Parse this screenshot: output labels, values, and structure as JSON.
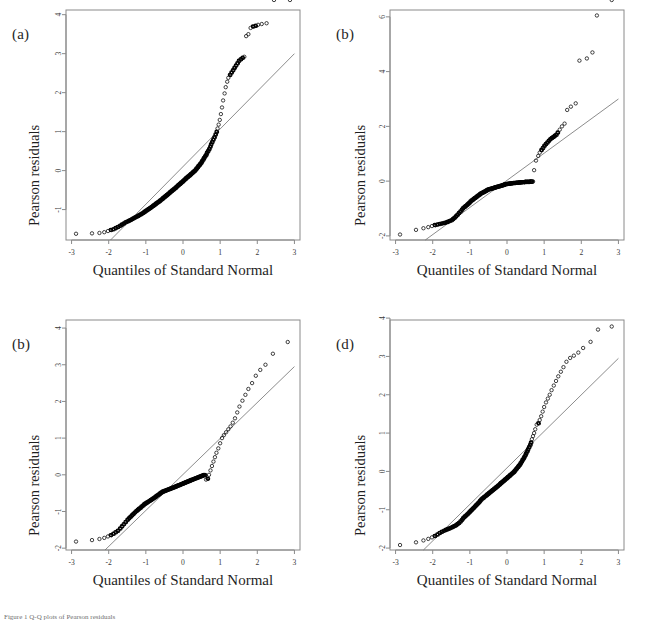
{
  "figure": {
    "caption": "Figure 1 Q-Q plots of Pearson residuals",
    "panel_count": 4,
    "background": "#ffffff",
    "marker_color": "#111111",
    "refline_color": "#6e6e6e",
    "frame_color": "#8a8a8a"
  },
  "chart_data": [
    {
      "type": "scatter",
      "panel": "a",
      "title": "(a)",
      "xlabel": "Quantiles of Standard Normal",
      "ylabel": "Pearson residuals",
      "xlim": [
        -3.15,
        3.15
      ],
      "ylim": [
        -1.78,
        4.12
      ],
      "xticks": [
        -3,
        -2,
        -1,
        0,
        1,
        2,
        3
      ],
      "xticklabels": [
        "-3",
        "-2",
        "-1",
        "0",
        "1",
        "2",
        "3"
      ],
      "yticks": [
        -1,
        0,
        1,
        2,
        3,
        4
      ],
      "yticklabels": [
        "-1",
        "0",
        "1",
        "2",
        "3",
        "4"
      ],
      "grid": false,
      "legend": null,
      "refline": {
        "x": [
          -1.95,
          3.0
        ],
        "y": [
          -1.78,
          3.0
        ],
        "slope": 0.9657,
        "intercept": 0.103
      },
      "x": [
        -2.88,
        -2.45,
        -2.25,
        -2.12,
        -2.02,
        -1.95,
        -1.88,
        -1.82,
        -1.76,
        -1.7,
        -1.65,
        -1.6,
        -1.55,
        -1.5,
        -1.46,
        -1.42,
        -1.38,
        -1.34,
        -1.3,
        -1.26,
        -1.22,
        -1.19,
        -1.15,
        -1.12,
        -1.08,
        -1.05,
        -1.02,
        -0.99,
        -0.96,
        -0.93,
        -0.9,
        -0.87,
        -0.84,
        -0.81,
        -0.78,
        -0.75,
        -0.73,
        -0.7,
        -0.67,
        -0.64,
        -0.62,
        -0.59,
        -0.56,
        -0.54,
        -0.51,
        -0.49,
        -0.46,
        -0.44,
        -0.41,
        -0.39,
        -0.36,
        -0.34,
        -0.31,
        -0.29,
        -0.26,
        -0.24,
        -0.21,
        -0.19,
        -0.17,
        -0.14,
        -0.12,
        -0.09,
        -0.07,
        -0.05,
        -0.02,
        0.0,
        0.02,
        0.05,
        0.07,
        0.09,
        0.12,
        0.14,
        0.17,
        0.19,
        0.21,
        0.24,
        0.26,
        0.29,
        0.31,
        0.34,
        0.36,
        0.39,
        0.41,
        0.44,
        0.46,
        0.49,
        0.51,
        0.54,
        0.56,
        0.59,
        0.62,
        0.64,
        0.67,
        0.7,
        0.73,
        0.75,
        0.78,
        0.81,
        0.84,
        0.87,
        0.9,
        0.93,
        0.96,
        0.99,
        1.02,
        1.05,
        1.08,
        1.12,
        1.15,
        1.19,
        1.22,
        1.26,
        1.3,
        1.34,
        1.38,
        1.42,
        1.46,
        1.5,
        1.55,
        1.6,
        1.65,
        1.7,
        1.76,
        1.82,
        1.88,
        1.95,
        2.02,
        2.12,
        2.25,
        2.45,
        2.88
      ],
      "y": [
        -1.62,
        -1.61,
        -1.6,
        -1.58,
        -1.55,
        -1.52,
        -1.5,
        -1.47,
        -1.44,
        -1.41,
        -1.38,
        -1.35,
        -1.32,
        -1.3,
        -1.28,
        -1.26,
        -1.24,
        -1.22,
        -1.2,
        -1.18,
        -1.16,
        -1.14,
        -1.12,
        -1.1,
        -1.08,
        -1.06,
        -1.04,
        -1.02,
        -1.0,
        -0.98,
        -0.96,
        -0.94,
        -0.92,
        -0.9,
        -0.88,
        -0.86,
        -0.84,
        -0.82,
        -0.8,
        -0.78,
        -0.76,
        -0.74,
        -0.72,
        -0.7,
        -0.68,
        -0.66,
        -0.64,
        -0.62,
        -0.6,
        -0.58,
        -0.56,
        -0.54,
        -0.52,
        -0.5,
        -0.48,
        -0.46,
        -0.44,
        -0.42,
        -0.4,
        -0.38,
        -0.36,
        -0.34,
        -0.32,
        -0.3,
        -0.28,
        -0.26,
        -0.24,
        -0.22,
        -0.2,
        -0.18,
        -0.16,
        -0.14,
        -0.12,
        -0.1,
        -0.08,
        -0.06,
        -0.04,
        -0.02,
        0.0,
        0.03,
        0.06,
        0.09,
        0.12,
        0.15,
        0.18,
        0.21,
        0.25,
        0.29,
        0.33,
        0.37,
        0.41,
        0.46,
        0.51,
        0.56,
        0.62,
        0.68,
        0.74,
        0.8,
        0.86,
        0.93,
        1.0,
        1.08,
        1.18,
        1.3,
        1.45,
        1.62,
        1.8,
        1.98,
        2.14,
        2.28,
        2.38,
        2.46,
        2.52,
        2.58,
        2.64,
        2.7,
        2.76,
        2.82,
        2.86,
        2.9,
        2.92,
        3.45,
        3.5,
        3.66,
        3.7,
        3.72,
        3.74,
        3.76,
        3.78
      ]
    },
    {
      "type": "scatter",
      "panel": "b",
      "title": "(b)",
      "xlabel": "Quantiles of Standard Normal",
      "ylabel": "Pearson residuals",
      "xlim": [
        -3.15,
        3.15
      ],
      "ylim": [
        -2.15,
        6.25
      ],
      "xticks": [
        -3,
        -2,
        -1,
        0,
        1,
        2,
        3
      ],
      "xticklabels": [
        "-3",
        "-2",
        "-1",
        "0",
        "1",
        "2",
        "3"
      ],
      "yticks": [
        -2,
        0,
        2,
        4,
        6
      ],
      "yticklabels": [
        "-2",
        "0",
        "2",
        "4",
        "6"
      ],
      "grid": false,
      "legend": null,
      "refline": {
        "x": [
          -2.2,
          3.0
        ],
        "y": [
          -2.15,
          3.0
        ],
        "slope": 0.9904,
        "intercept": 0.0288
      },
      "x": [
        -2.88,
        -2.45,
        -2.25,
        -2.12,
        -2.02,
        -1.95,
        -1.88,
        -1.82,
        -1.76,
        -1.7,
        -1.65,
        -1.6,
        -1.55,
        -1.5,
        -1.46,
        -1.42,
        -1.38,
        -1.34,
        -1.3,
        -1.26,
        -1.22,
        -1.19,
        -1.15,
        -1.12,
        -1.08,
        -1.05,
        -1.02,
        -0.99,
        -0.96,
        -0.93,
        -0.9,
        -0.87,
        -0.84,
        -0.81,
        -0.78,
        -0.75,
        -0.73,
        -0.7,
        -0.67,
        -0.64,
        -0.62,
        -0.59,
        -0.56,
        -0.54,
        -0.51,
        -0.49,
        -0.46,
        -0.44,
        -0.41,
        -0.39,
        -0.36,
        -0.34,
        -0.31,
        -0.29,
        -0.26,
        -0.24,
        -0.21,
        -0.19,
        -0.17,
        -0.14,
        -0.12,
        -0.09,
        -0.07,
        -0.05,
        -0.02,
        0.0,
        0.02,
        0.05,
        0.07,
        0.09,
        0.12,
        0.14,
        0.17,
        0.19,
        0.21,
        0.24,
        0.26,
        0.29,
        0.31,
        0.34,
        0.36,
        0.39,
        0.41,
        0.44,
        0.46,
        0.49,
        0.51,
        0.54,
        0.56,
        0.59,
        0.62,
        0.64,
        0.67,
        0.7,
        0.73,
        0.78,
        0.84,
        0.88,
        0.92,
        0.96,
        1.0,
        1.04,
        1.08,
        1.12,
        1.16,
        1.2,
        1.24,
        1.28,
        1.32,
        1.36,
        1.42,
        1.48,
        1.55,
        1.62,
        1.72,
        1.85,
        1.95,
        2.15,
        2.3,
        2.42,
        2.82
      ],
      "y": [
        -1.95,
        -1.78,
        -1.72,
        -1.68,
        -1.64,
        -1.6,
        -1.58,
        -1.56,
        -1.54,
        -1.52,
        -1.5,
        -1.48,
        -1.45,
        -1.42,
        -1.38,
        -1.33,
        -1.28,
        -1.22,
        -1.16,
        -1.1,
        -1.04,
        -0.98,
        -0.94,
        -0.9,
        -0.86,
        -0.82,
        -0.78,
        -0.74,
        -0.7,
        -0.67,
        -0.64,
        -0.61,
        -0.58,
        -0.55,
        -0.52,
        -0.49,
        -0.46,
        -0.44,
        -0.42,
        -0.4,
        -0.38,
        -0.36,
        -0.34,
        -0.32,
        -0.3,
        -0.29,
        -0.28,
        -0.27,
        -0.26,
        -0.25,
        -0.24,
        -0.23,
        -0.22,
        -0.21,
        -0.2,
        -0.19,
        -0.18,
        -0.17,
        -0.16,
        -0.15,
        -0.14,
        -0.13,
        -0.12,
        -0.11,
        -0.1,
        -0.1,
        -0.09,
        -0.09,
        -0.08,
        -0.08,
        -0.07,
        -0.07,
        -0.06,
        -0.06,
        -0.06,
        -0.05,
        -0.05,
        -0.05,
        -0.04,
        -0.04,
        -0.04,
        -0.03,
        -0.03,
        -0.03,
        -0.03,
        -0.02,
        -0.02,
        -0.02,
        -0.02,
        -0.02,
        -0.01,
        -0.01,
        -0.01,
        -0.01,
        0.4,
        0.75,
        0.92,
        1.04,
        1.14,
        1.22,
        1.3,
        1.36,
        1.42,
        1.48,
        1.54,
        1.58,
        1.62,
        1.66,
        1.7,
        1.78,
        1.88,
        2.0,
        2.1,
        2.6,
        2.72,
        2.84,
        4.4,
        4.48,
        4.7,
        6.05
      ]
    },
    {
      "type": "scatter",
      "panel": "c",
      "title": "(b)",
      "xlabel": "Quantiles of Standard Normal",
      "ylabel": "Pearson residuals",
      "xlim": [
        -3.15,
        3.15
      ],
      "ylim": [
        -2.05,
        4.22
      ],
      "xticks": [
        -3,
        -2,
        -1,
        0,
        1,
        2,
        3
      ],
      "xticklabels": [
        "-3",
        "-2",
        "-1",
        "0",
        "1",
        "2",
        "3"
      ],
      "yticks": [
        -2,
        -1,
        0,
        1,
        2,
        3,
        4
      ],
      "yticklabels": [
        "-2",
        "-1",
        "0",
        "1",
        "2",
        "3",
        "4"
      ],
      "grid": false,
      "legend": null,
      "refline": {
        "x": [
          -2.1,
          3.0
        ],
        "y": [
          -2.05,
          2.95
        ],
        "slope": 0.9804,
        "intercept": 0.0088
      },
      "x": [
        -2.88,
        -2.45,
        -2.25,
        -2.12,
        -2.02,
        -1.95,
        -1.88,
        -1.82,
        -1.76,
        -1.7,
        -1.65,
        -1.6,
        -1.55,
        -1.5,
        -1.46,
        -1.42,
        -1.38,
        -1.34,
        -1.3,
        -1.26,
        -1.22,
        -1.19,
        -1.15,
        -1.12,
        -1.08,
        -1.05,
        -1.02,
        -0.99,
        -0.96,
        -0.93,
        -0.9,
        -0.87,
        -0.84,
        -0.81,
        -0.78,
        -0.75,
        -0.73,
        -0.7,
        -0.67,
        -0.64,
        -0.62,
        -0.59,
        -0.56,
        -0.54,
        -0.51,
        -0.49,
        -0.46,
        -0.44,
        -0.41,
        -0.39,
        -0.36,
        -0.34,
        -0.31,
        -0.29,
        -0.26,
        -0.24,
        -0.21,
        -0.19,
        -0.17,
        -0.14,
        -0.12,
        -0.09,
        -0.07,
        -0.05,
        -0.02,
        0.0,
        0.02,
        0.05,
        0.07,
        0.09,
        0.12,
        0.14,
        0.17,
        0.19,
        0.21,
        0.24,
        0.26,
        0.29,
        0.31,
        0.34,
        0.36,
        0.39,
        0.41,
        0.44,
        0.46,
        0.49,
        0.51,
        0.54,
        0.56,
        0.59,
        0.62,
        0.66,
        0.7,
        0.74,
        0.78,
        0.82,
        0.86,
        0.9,
        0.95,
        1.0,
        1.05,
        1.1,
        1.16,
        1.22,
        1.28,
        1.34,
        1.4,
        1.46,
        1.52,
        1.6,
        1.68,
        1.76,
        1.86,
        1.96,
        2.08,
        2.22,
        2.42,
        2.82
      ],
      "y": [
        -1.82,
        -1.78,
        -1.75,
        -1.72,
        -1.68,
        -1.64,
        -1.6,
        -1.56,
        -1.52,
        -1.46,
        -1.4,
        -1.34,
        -1.28,
        -1.22,
        -1.18,
        -1.14,
        -1.1,
        -1.06,
        -1.02,
        -0.98,
        -0.95,
        -0.92,
        -0.89,
        -0.86,
        -0.83,
        -0.8,
        -0.78,
        -0.76,
        -0.74,
        -0.72,
        -0.7,
        -0.68,
        -0.66,
        -0.64,
        -0.62,
        -0.6,
        -0.58,
        -0.56,
        -0.54,
        -0.52,
        -0.5,
        -0.48,
        -0.46,
        -0.45,
        -0.44,
        -0.43,
        -0.42,
        -0.41,
        -0.4,
        -0.39,
        -0.38,
        -0.37,
        -0.36,
        -0.35,
        -0.34,
        -0.33,
        -0.32,
        -0.31,
        -0.3,
        -0.29,
        -0.28,
        -0.27,
        -0.26,
        -0.25,
        -0.24,
        -0.23,
        -0.22,
        -0.21,
        -0.2,
        -0.19,
        -0.18,
        -0.17,
        -0.16,
        -0.15,
        -0.14,
        -0.13,
        -0.12,
        -0.11,
        -0.1,
        -0.09,
        -0.08,
        -0.07,
        -0.06,
        -0.05,
        -0.04,
        -0.03,
        -0.02,
        -0.01,
        0.0,
        0.0,
        -0.13,
        -0.1,
        0.0,
        0.12,
        0.24,
        0.36,
        0.48,
        0.6,
        0.72,
        0.86,
        1.0,
        1.08,
        1.16,
        1.24,
        1.32,
        1.42,
        1.54,
        1.7,
        1.86,
        2.02,
        2.18,
        2.34,
        2.5,
        2.7,
        2.86,
        3.0,
        3.3,
        3.62,
        4.12
      ]
    },
    {
      "type": "scatter",
      "panel": "d",
      "title": "(d)",
      "xlabel": "Quantiles of Standard Normal",
      "ylabel": "Pearson residuals",
      "xlim": [
        -3.15,
        3.15
      ],
      "ylim": [
        -2.05,
        3.95
      ],
      "xticks": [
        -3,
        -2,
        -1,
        0,
        1,
        2,
        3
      ],
      "xticklabels": [
        "-3",
        "-2",
        "-1",
        "0",
        "1",
        "2",
        "3"
      ],
      "yticks": [
        -2,
        -1,
        0,
        1,
        2,
        3,
        4
      ],
      "yticklabels": [
        "-2",
        "-1",
        "0",
        "1",
        "2",
        "3",
        "4"
      ],
      "grid": false,
      "legend": null,
      "refline": {
        "x": [
          -2.25,
          3.0
        ],
        "y": [
          -2.05,
          2.95
        ],
        "slope": 0.9524,
        "intercept": 0.0929
      },
      "x": [
        -2.88,
        -2.45,
        -2.25,
        -2.12,
        -2.02,
        -1.95,
        -1.88,
        -1.82,
        -1.76,
        -1.7,
        -1.65,
        -1.6,
        -1.55,
        -1.5,
        -1.46,
        -1.42,
        -1.38,
        -1.34,
        -1.3,
        -1.26,
        -1.22,
        -1.19,
        -1.15,
        -1.12,
        -1.08,
        -1.05,
        -1.02,
        -0.99,
        -0.96,
        -0.93,
        -0.9,
        -0.87,
        -0.84,
        -0.81,
        -0.78,
        -0.75,
        -0.73,
        -0.7,
        -0.67,
        -0.64,
        -0.62,
        -0.59,
        -0.56,
        -0.54,
        -0.51,
        -0.49,
        -0.46,
        -0.44,
        -0.41,
        -0.39,
        -0.36,
        -0.34,
        -0.31,
        -0.29,
        -0.26,
        -0.24,
        -0.21,
        -0.19,
        -0.17,
        -0.14,
        -0.12,
        -0.09,
        -0.07,
        -0.05,
        -0.02,
        0.0,
        0.02,
        0.05,
        0.07,
        0.09,
        0.12,
        0.14,
        0.17,
        0.19,
        0.21,
        0.24,
        0.26,
        0.29,
        0.31,
        0.34,
        0.36,
        0.39,
        0.41,
        0.44,
        0.46,
        0.49,
        0.51,
        0.54,
        0.56,
        0.59,
        0.62,
        0.64,
        0.67,
        0.7,
        0.73,
        0.76,
        0.8,
        0.84,
        0.88,
        0.92,
        0.96,
        1.0,
        1.05,
        1.1,
        1.15,
        1.2,
        1.26,
        1.32,
        1.38,
        1.45,
        1.52,
        1.6,
        1.7,
        1.8,
        1.92,
        2.05,
        2.25,
        2.45,
        2.82
      ],
      "y": [
        -1.92,
        -1.85,
        -1.8,
        -1.76,
        -1.72,
        -1.68,
        -1.64,
        -1.6,
        -1.57,
        -1.54,
        -1.52,
        -1.5,
        -1.48,
        -1.46,
        -1.44,
        -1.42,
        -1.4,
        -1.37,
        -1.34,
        -1.3,
        -1.26,
        -1.22,
        -1.18,
        -1.15,
        -1.12,
        -1.09,
        -1.06,
        -1.03,
        -1.0,
        -0.97,
        -0.94,
        -0.91,
        -0.88,
        -0.85,
        -0.82,
        -0.79,
        -0.76,
        -0.73,
        -0.7,
        -0.68,
        -0.66,
        -0.64,
        -0.62,
        -0.6,
        -0.58,
        -0.56,
        -0.54,
        -0.52,
        -0.5,
        -0.48,
        -0.46,
        -0.44,
        -0.42,
        -0.4,
        -0.38,
        -0.36,
        -0.34,
        -0.32,
        -0.3,
        -0.28,
        -0.26,
        -0.24,
        -0.22,
        -0.2,
        -0.18,
        -0.16,
        -0.14,
        -0.12,
        -0.1,
        -0.08,
        -0.06,
        -0.04,
        -0.02,
        0.0,
        0.03,
        0.06,
        0.09,
        0.12,
        0.15,
        0.18,
        0.22,
        0.26,
        0.3,
        0.34,
        0.38,
        0.43,
        0.48,
        0.53,
        0.58,
        0.64,
        0.7,
        0.76,
        0.84,
        0.92,
        1.0,
        1.1,
        1.22,
        1.26,
        1.34,
        1.44,
        1.56,
        1.68,
        1.8,
        1.9,
        2.0,
        2.12,
        2.24,
        2.36,
        2.48,
        2.6,
        2.72,
        2.86,
        2.96,
        3.02,
        3.1,
        3.22,
        3.38,
        3.7,
        3.78
      ]
    }
  ]
}
